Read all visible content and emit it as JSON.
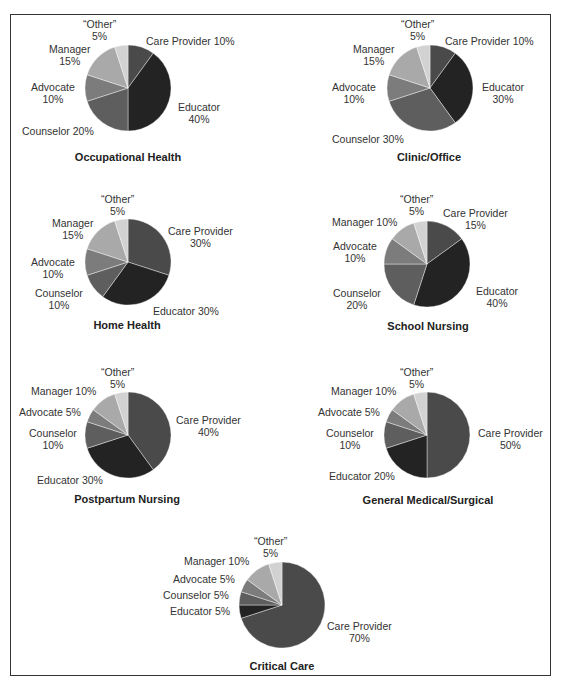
{
  "colors": {
    "Care Provider": "#4a4a4a",
    "Educator": "#232323",
    "Counselor": "#5e5e5e",
    "Advocate": "#7c7c7c",
    "Manager": "#a9a9a9",
    "Other": "#d2d2d2"
  },
  "chart_data": [
    {
      "type": "pie",
      "title": "Occupational Health",
      "labels": [
        "Care Provider",
        "Educator",
        "Counselor",
        "Advocate",
        "Manager",
        "“Other”"
      ],
      "values": [
        10,
        40,
        20,
        10,
        15,
        5
      ]
    },
    {
      "type": "pie",
      "title": "Clinic/Office",
      "labels": [
        "Care Provider",
        "Educator",
        "Counselor",
        "Advocate",
        "Manager",
        "“Other”"
      ],
      "values": [
        10,
        30,
        30,
        10,
        15,
        5
      ]
    },
    {
      "type": "pie",
      "title": "Home Health",
      "labels": [
        "Care Provider",
        "Educator",
        "Counselor",
        "Advocate",
        "Manager",
        "“Other”"
      ],
      "values": [
        30,
        30,
        10,
        10,
        15,
        5
      ]
    },
    {
      "type": "pie",
      "title": "School Nursing",
      "labels": [
        "Care Provider",
        "Educator",
        "Counselor",
        "Advocate",
        "Manager",
        "“Other”"
      ],
      "values": [
        15,
        40,
        20,
        10,
        10,
        5
      ]
    },
    {
      "type": "pie",
      "title": "Postpartum Nursing",
      "labels": [
        "Care Provider",
        "Educator",
        "Counselor",
        "Advocate",
        "Manager",
        "“Other”"
      ],
      "values": [
        40,
        30,
        10,
        5,
        10,
        5
      ]
    },
    {
      "type": "pie",
      "title": "General Medical/Surgical",
      "labels": [
        "Care Provider",
        "Educator",
        "Counselor",
        "Advocate",
        "Manager",
        "“Other”"
      ],
      "values": [
        50,
        20,
        10,
        5,
        10,
        5
      ]
    },
    {
      "type": "pie",
      "title": "Critical Care",
      "labels": [
        "Care Provider",
        "Educator",
        "Counselor",
        "Advocate",
        "Manager",
        "“Other”"
      ],
      "values": [
        70,
        5,
        5,
        5,
        10,
        5
      ]
    }
  ],
  "charts": [
    {
      "title": "Occupational Health",
      "labels": {
        "other_name": "“Other”",
        "other_pct": "5%",
        "care": "Care Provider 10%",
        "educator_name": "Educator",
        "educator_pct": "40%",
        "counselor": "Counselor 20%",
        "advocate_name": "Advocate",
        "advocate_pct": "10%",
        "manager_name": "Manager",
        "manager_pct": "15%"
      }
    },
    {
      "title": "Clinic/Office",
      "labels": {
        "other_name": "“Other”",
        "other_pct": "5%",
        "care": "Care Provider 10%",
        "educator_name": "Educator",
        "educator_pct": "30%",
        "counselor": "Counselor 30%",
        "advocate_name": "Advocate",
        "advocate_pct": "10%",
        "manager_name": "Manager",
        "manager_pct": "15%"
      }
    },
    {
      "title": "Home Health",
      "labels": {
        "other_name": "“Other”",
        "other_pct": "5%",
        "care_name": "Care Provider",
        "care_pct": "30%",
        "educator": "Educator 30%",
        "counselor_name": "Counselor",
        "counselor_pct": "10%",
        "advocate_name": "Advocate",
        "advocate_pct": "10%",
        "manager_name": "Manager",
        "manager_pct": "15%"
      }
    },
    {
      "title": "School Nursing",
      "labels": {
        "other_name": "“Other”",
        "other_pct": "5%",
        "care_name": "Care Provider",
        "care_pct": "15%",
        "educator_name": "Educator",
        "educator_pct": "40%",
        "counselor_name": "Counselor",
        "counselor_pct": "20%",
        "advocate_name": "Advocate",
        "advocate_pct": "10%",
        "manager": "Manager 10%"
      }
    },
    {
      "title": "Postpartum Nursing",
      "labels": {
        "other_name": "“Other”",
        "other_pct": "5%",
        "care_name": "Care Provider",
        "care_pct": "40%",
        "educator": "Educator 30%",
        "counselor_name": "Counselor",
        "counselor_pct": "10%",
        "advocate": "Advocate 5%",
        "manager": "Manager 10%"
      }
    },
    {
      "title": "General Medical/Surgical",
      "labels": {
        "other_name": "“Other”",
        "other_pct": "5%",
        "care_name": "Care Provider",
        "care_pct": "50%",
        "educator": "Educator 20%",
        "counselor_name": "Counselor",
        "counselor_pct": "10%",
        "advocate": "Advocate 5%",
        "manager": "Manager 10%"
      }
    },
    {
      "title": "Critical Care",
      "labels": {
        "other_name": "“Other”",
        "other_pct": "5%",
        "care_name": "Care Provider",
        "care_pct": "70%",
        "educator": "Educator 5%",
        "counselor": "Counselor 5%",
        "advocate": "Advocate 5%",
        "manager": "Manager 10%"
      }
    }
  ]
}
